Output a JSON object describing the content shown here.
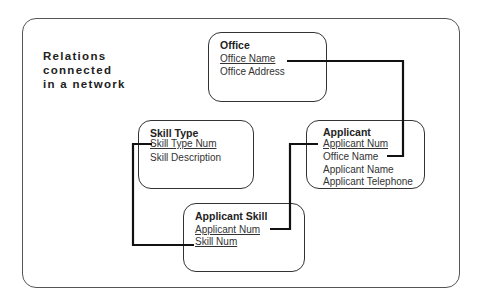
{
  "caption": "Relations\nconnected\nin a network",
  "entities": {
    "office": {
      "title": "Office",
      "attributes": [
        {
          "label": "Office Name",
          "key": true
        },
        {
          "label": "Office Address",
          "key": false
        }
      ]
    },
    "skill_type": {
      "title": "Skill Type",
      "attributes": [
        {
          "label": "Skill Type Num",
          "key": true
        },
        {
          "label": "Skill Description",
          "key": false
        }
      ]
    },
    "applicant": {
      "title": "Applicant",
      "attributes": [
        {
          "label": "Applicant Num",
          "key": true
        },
        {
          "label": "Office Name",
          "key": false
        },
        {
          "label": "Applicant Name",
          "key": false
        },
        {
          "label": "Applicant Telephone",
          "key": false
        }
      ]
    },
    "applicant_skill": {
      "title": "Applicant Skill",
      "attributes": [
        {
          "label": "Applicant Num",
          "key": true
        },
        {
          "label": "Skill Num",
          "key": true
        }
      ]
    }
  },
  "links": [
    {
      "from": "office.Office Name",
      "to": "applicant.Office Name"
    },
    {
      "from": "applicant.Applicant Num",
      "to": "applicant_skill.Applicant Num"
    },
    {
      "from": "skill_type.Skill Type Num",
      "to": "applicant_skill.Skill Num"
    }
  ],
  "colors": {
    "line": "#111111",
    "border": "#333333",
    "text": "#222222"
  }
}
